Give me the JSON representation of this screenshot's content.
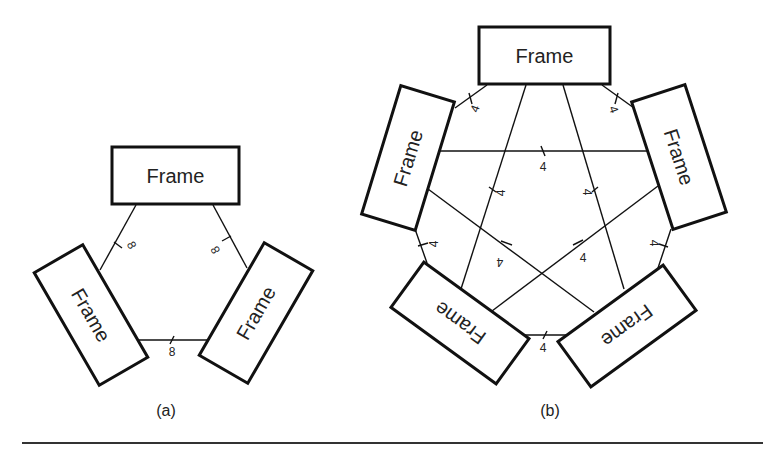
{
  "figure": {
    "rule_color": "#333333"
  },
  "diagram_a": {
    "caption": "(a)",
    "frames": [
      {
        "label": "Frame",
        "position": "top"
      },
      {
        "label": "Frame",
        "position": "left"
      },
      {
        "label": "Frame",
        "position": "right"
      }
    ],
    "links": [
      {
        "from": "top",
        "to": "left",
        "weight": "8"
      },
      {
        "from": "top",
        "to": "right",
        "weight": "8"
      },
      {
        "from": "left",
        "to": "right",
        "weight": "8"
      }
    ]
  },
  "diagram_b": {
    "caption": "(b)",
    "frames": [
      {
        "label": "Frame",
        "position": "top"
      },
      {
        "label": "Frame",
        "position": "left"
      },
      {
        "label": "Frame",
        "position": "right"
      },
      {
        "label": "Frame",
        "position": "bottom-left"
      },
      {
        "label": "Frame",
        "position": "bottom-right"
      }
    ],
    "links": [
      {
        "from": "top",
        "to": "left",
        "weight": "4"
      },
      {
        "from": "top",
        "to": "right",
        "weight": "4"
      },
      {
        "from": "left",
        "to": "right",
        "weight": "4"
      },
      {
        "from": "top",
        "to": "bottom-left",
        "weight": "4"
      },
      {
        "from": "top",
        "to": "bottom-right",
        "weight": "4"
      },
      {
        "from": "left",
        "to": "bottom-left",
        "weight": "4"
      },
      {
        "from": "right",
        "to": "bottom-right",
        "weight": "4"
      },
      {
        "from": "left",
        "to": "bottom-right",
        "weight": "4"
      },
      {
        "from": "right",
        "to": "bottom-left",
        "weight": "4"
      },
      {
        "from": "bottom-left",
        "to": "bottom-right",
        "weight": "4"
      }
    ]
  }
}
